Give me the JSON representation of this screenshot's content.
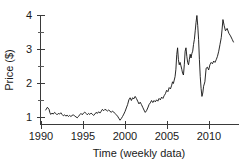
{
  "figure": {
    "title_fragment": "",
    "background_color": "#ffffff",
    "line_color": "#111111",
    "axis_color": "#3a3a3a"
  },
  "chart_data": {
    "type": "line",
    "title": "",
    "subtitle": "",
    "xlabel": "Time (weekly data)",
    "ylabel": "Price ($)",
    "xlim": [
      1989.4,
      1990.0
    ],
    "x_axis_start": 1989.4,
    "x_axis_end": 2012.9,
    "ylim": [
      0.62,
      4.25
    ],
    "grid": false,
    "legend": null,
    "x_ticks": [
      1990,
      1995,
      2000,
      2005,
      2010
    ],
    "x_tick_labels": [
      "1990",
      "1995",
      "2000",
      "2005",
      "2010"
    ],
    "y_ticks": [
      1,
      2,
      3,
      4
    ],
    "y_tick_labels": [
      "1",
      "2",
      "3",
      "4"
    ],
    "y_minor_ticks": [
      1.5,
      2.5,
      3.5
    ],
    "series": [
      {
        "name": "Price",
        "x": [
          1990.5,
          1990.7,
          1990.9,
          1991.0,
          1991.1,
          1991.25,
          1991.4,
          1991.55,
          1991.7,
          1991.85,
          1992.0,
          1992.15,
          1992.3,
          1992.45,
          1992.6,
          1992.75,
          1992.9,
          1993.05,
          1993.2,
          1993.35,
          1993.5,
          1993.65,
          1993.8,
          1993.95,
          1994.1,
          1994.25,
          1994.4,
          1994.55,
          1994.7,
          1994.85,
          1995.0,
          1995.15,
          1995.3,
          1995.45,
          1995.6,
          1995.75,
          1995.9,
          1996.05,
          1996.2,
          1996.35,
          1996.5,
          1996.65,
          1996.8,
          1996.95,
          1997.1,
          1997.25,
          1997.4,
          1997.55,
          1997.7,
          1997.85,
          1998.0,
          1998.15,
          1998.3,
          1998.45,
          1998.6,
          1998.75,
          1998.9,
          1999.05,
          1999.2,
          1999.35,
          1999.5,
          1999.65,
          1999.8,
          1999.95,
          2000.1,
          2000.25,
          2000.4,
          2000.55,
          2000.7,
          2000.85,
          2001.0,
          2001.15,
          2001.3,
          2001.45,
          2001.6,
          2001.75,
          2001.9,
          2002.05,
          2002.2,
          2002.35,
          2002.5,
          2002.65,
          2002.8,
          2002.95,
          2003.1,
          2003.25,
          2003.4,
          2003.55,
          2003.7,
          2003.85,
          2004.0,
          2004.15,
          2004.3,
          2004.45,
          2004.6,
          2004.75,
          2004.9,
          2005.05,
          2005.2,
          2005.35,
          2005.5,
          2005.6,
          2005.7,
          2005.8,
          2005.9,
          2006.0,
          2006.1,
          2006.2,
          2006.3,
          2006.4,
          2006.5,
          2006.6,
          2006.7,
          2006.8,
          2006.9,
          2007.0,
          2007.1,
          2007.2,
          2007.3,
          2007.4,
          2007.5,
          2007.6,
          2007.7,
          2007.8,
          2007.9,
          2008.0,
          2008.1,
          2008.2,
          2008.3,
          2008.4,
          2008.5,
          2008.6,
          2008.7,
          2008.8,
          2008.9,
          2009.0,
          2009.1,
          2009.2,
          2009.3,
          2009.45,
          2009.6,
          2009.75,
          2009.9,
          2010.05,
          2010.2,
          2010.35,
          2010.5,
          2010.65,
          2010.8,
          2010.95,
          2011.1,
          2011.25,
          2011.4,
          2011.5,
          2011.6,
          2011.75,
          2011.9,
          2012.1,
          2012.3,
          2012.5,
          2012.7,
          2012.85
        ],
        "y": [
          1.22,
          1.3,
          1.24,
          1.14,
          1.09,
          1.13,
          1.1,
          1.15,
          1.12,
          1.08,
          1.12,
          1.1,
          1.14,
          1.09,
          1.05,
          1.08,
          1.04,
          1.07,
          1.03,
          1.06,
          1.03,
          1.06,
          1.08,
          1.04,
          1.02,
          0.99,
          1.03,
          1.08,
          1.12,
          1.08,
          1.13,
          1.16,
          1.12,
          1.08,
          1.12,
          1.09,
          1.13,
          1.1,
          1.06,
          1.1,
          1.15,
          1.12,
          1.17,
          1.13,
          1.18,
          1.24,
          1.2,
          1.24,
          1.22,
          1.19,
          1.22,
          1.19,
          1.15,
          1.19,
          1.16,
          1.12,
          1.08,
          1.04,
          0.98,
          0.92,
          0.97,
          1.03,
          1.1,
          1.18,
          1.28,
          1.38,
          1.52,
          1.58,
          1.5,
          1.58,
          1.55,
          1.62,
          1.56,
          1.48,
          1.4,
          1.45,
          1.38,
          1.3,
          1.22,
          1.15,
          1.2,
          1.28,
          1.38,
          1.43,
          1.5,
          1.44,
          1.5,
          1.46,
          1.52,
          1.48,
          1.56,
          1.52,
          1.6,
          1.56,
          1.64,
          1.7,
          1.8,
          1.76,
          1.88,
          1.84,
          1.95,
          2.05,
          2.0,
          2.1,
          2.2,
          2.42,
          2.85,
          3.05,
          2.7,
          2.55,
          2.62,
          2.52,
          2.42,
          2.3,
          2.25,
          2.55,
          2.95,
          3.05,
          2.8,
          2.62,
          2.55,
          2.7,
          2.86,
          2.75,
          2.88,
          2.95,
          3.15,
          3.3,
          3.55,
          3.8,
          4.0,
          3.7,
          3.3,
          2.7,
          2.2,
          1.85,
          1.62,
          1.72,
          1.92,
          2.05,
          2.45,
          2.48,
          2.4,
          2.55,
          2.62,
          2.58,
          2.66,
          2.62,
          2.7,
          2.8,
          2.95,
          3.15,
          3.35,
          3.6,
          3.88,
          3.7,
          3.55,
          3.62,
          3.48,
          3.4,
          3.3,
          3.22
        ]
      }
    ]
  }
}
